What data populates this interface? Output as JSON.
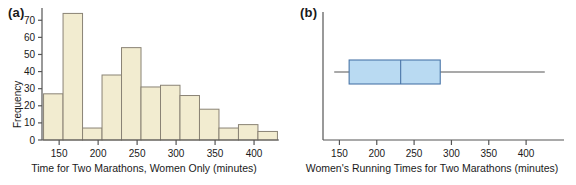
{
  "figure": {
    "panels": [
      {
        "tag": "(a)",
        "xlabel": "Time for Two Marathons, Women Only (minutes)",
        "ylabel": "Frequency"
      },
      {
        "tag": "(b)",
        "xlabel": "Women's Running Times for Two Marathons (minutes)",
        "ylabel": ""
      }
    ]
  },
  "colors": {
    "bar_fill": "#f2ecd0",
    "bar_stroke": "#8a8375",
    "box_fill": "#b9daf2",
    "box_stroke": "#4a76a8",
    "axis": "#555555",
    "text": "#1a1a1a"
  },
  "chart_data": [
    {
      "type": "bar",
      "title": "",
      "subtitle": "",
      "panel": "(a)",
      "xlabel": "Time for Two Marathons, Women Only (minutes)",
      "ylabel": "Frequency",
      "xlim": [
        128,
        432
      ],
      "ylim": [
        0,
        76
      ],
      "grid": false,
      "legend": null,
      "xticks": [
        150,
        200,
        250,
        300,
        350,
        400
      ],
      "xticklabels": [
        "150",
        "200",
        "250",
        "300",
        "350",
        "400"
      ],
      "yticks": [
        0,
        10,
        20,
        30,
        40,
        50,
        60,
        70
      ],
      "yticklabels": [
        "0",
        "10",
        "20",
        "30",
        "40",
        "50",
        "60",
        "70"
      ],
      "bin_width": 25,
      "bin_edges": [
        130,
        155,
        180,
        205,
        230,
        255,
        280,
        305,
        330,
        355,
        380,
        405,
        430
      ],
      "categories": [
        "130-155",
        "155-180",
        "180-205",
        "205-230",
        "230-255",
        "255-280",
        "280-305",
        "305-330",
        "330-355",
        "355-380",
        "380-405",
        "405-430"
      ],
      "values": [
        27,
        74,
        7,
        38,
        54,
        31,
        32,
        26,
        18,
        7,
        9,
        5
      ]
    },
    {
      "type": "boxplot",
      "title": "",
      "panel": "(b)",
      "xlabel": "Women's Running Times for Two Marathons (minutes)",
      "ylabel": "",
      "orientation": "horizontal",
      "xlim": [
        128,
        432
      ],
      "grid": false,
      "legend": null,
      "xticks": [
        150,
        200,
        250,
        300,
        350,
        400
      ],
      "xticklabels": [
        "150",
        "200",
        "250",
        "300",
        "350",
        "400"
      ],
      "box": {
        "min": 143,
        "q1": 163,
        "median": 232,
        "q3": 285,
        "max": 425,
        "outliers": []
      }
    }
  ]
}
